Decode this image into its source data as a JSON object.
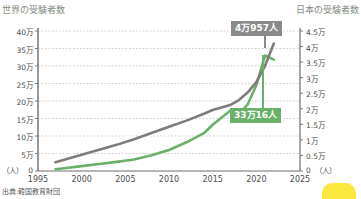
{
  "chart_data": {
    "type": "line",
    "title": "",
    "left_axis": {
      "label": "世界の受験者数",
      "unit": "（人）",
      "ticks": [
        "0",
        "5万",
        "10万",
        "15万",
        "20万",
        "25万",
        "30万",
        "35万",
        "40万"
      ],
      "values": [
        0,
        50000,
        100000,
        150000,
        200000,
        250000,
        300000,
        350000,
        400000
      ],
      "ylim": [
        0,
        400000
      ]
    },
    "right_axis": {
      "label": "日本の受験者数",
      "unit": "（人）",
      "ticks": [
        "0",
        "0.5万",
        "1万",
        "1.5万",
        "2万",
        "2.5万",
        "3万",
        "3.5万",
        "4万",
        "4.5万"
      ],
      "values": [
        0,
        5000,
        10000,
        15000,
        20000,
        25000,
        30000,
        35000,
        40000,
        45000
      ],
      "ylim": [
        0,
        45000
      ]
    },
    "xlabel": "",
    "xlim": [
      1995,
      2025
    ],
    "xticks": [
      "1995",
      "2000",
      "2005",
      "2010",
      "2015",
      "2020",
      "2025"
    ],
    "xtick_values": [
      1995,
      2000,
      2005,
      2010,
      2015,
      2020,
      2025
    ],
    "grid": true,
    "legend_position": "none",
    "series": [
      {
        "name": "世界の受験者数",
        "color": "#6ab06a",
        "axis": "left",
        "x": [
          1997,
          1998,
          2000,
          2002,
          2004,
          2006,
          2008,
          2010,
          2012,
          2014,
          2015,
          2016,
          2017,
          2018,
          2019,
          2020,
          2021,
          2022
        ],
        "values": [
          5000,
          8000,
          14000,
          20000,
          26000,
          33000,
          45000,
          60000,
          82000,
          108000,
          132000,
          152000,
          172000,
          162000,
          190000,
          245000,
          330016,
          318000
        ]
      },
      {
        "name": "日本の受験者数",
        "color": "#7f7c7a",
        "axis": "right",
        "x": [
          1997,
          1998,
          2000,
          2002,
          2004,
          2006,
          2008,
          2010,
          2012,
          2014,
          2015,
          2016,
          2017,
          2018,
          2019,
          2020,
          2021,
          2022
        ],
        "values": [
          2800,
          3600,
          5200,
          6800,
          8400,
          10200,
          12200,
          14200,
          16200,
          18400,
          19600,
          20400,
          21200,
          22800,
          25200,
          28600,
          33800,
          40957
        ]
      }
    ],
    "annotations": [
      {
        "id": "callout-gray",
        "text": "4万957人",
        "color": "#8a8a8a",
        "series": "日本の受験者数",
        "value": 40957
      },
      {
        "id": "callout-green",
        "text": "33万16人",
        "color": "#6ab06a",
        "series": "世界の受験者数",
        "value": 330016
      }
    ],
    "source": "出典:韓国教育財団"
  }
}
